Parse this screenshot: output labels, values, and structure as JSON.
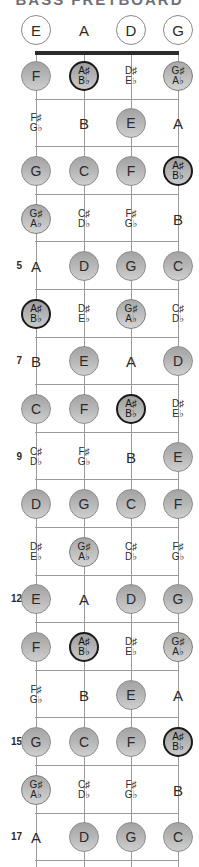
{
  "title_sliver": "BASS FRETBOARD",
  "diagram": {
    "instrument": "bass-guitar-fretboard",
    "string_labels": [
      "E",
      "A",
      "D",
      "G"
    ],
    "fret_number_labels": [
      "5",
      "7",
      "9",
      "12",
      "15",
      "17"
    ],
    "colors": {
      "nut": "#2b2b2b",
      "line": "#9a9a9a",
      "note_fill_top": "#a3a3a3",
      "note_fill_bottom": "#cfcfcf",
      "note_border": "#8d8d8d",
      "accent_border": "#1a1a1a",
      "text": "#2b2b2b",
      "background": "#ffffff"
    }
  },
  "open_strings": [
    {
      "label": "E",
      "style": "open"
    },
    {
      "label": "A",
      "style": "plain"
    },
    {
      "label": "D",
      "style": "open"
    },
    {
      "label": "G",
      "style": "open"
    }
  ],
  "frets": [
    {
      "number": 1,
      "number_shown": "",
      "notes": [
        {
          "label": "F",
          "style": "circ"
        },
        {
          "sharp": "A♯",
          "flat": "B♭",
          "style": "accent"
        },
        {
          "sharp": "D♯",
          "flat": "E♭",
          "style": "bare"
        },
        {
          "sharp": "G♯",
          "flat": "A♭",
          "style": "accentlite"
        }
      ]
    },
    {
      "number": 2,
      "number_shown": "",
      "notes": [
        {
          "sharp": "F♯",
          "flat": "G♭",
          "style": "bare"
        },
        {
          "label": "B",
          "style": "plain"
        },
        {
          "label": "E",
          "style": "circ"
        },
        {
          "label": "A",
          "style": "plain"
        }
      ]
    },
    {
      "number": 3,
      "number_shown": "",
      "notes": [
        {
          "label": "G",
          "style": "circ"
        },
        {
          "label": "C",
          "style": "circ"
        },
        {
          "label": "F",
          "style": "circ"
        },
        {
          "sharp": "A♯",
          "flat": "B♭",
          "style": "accent"
        }
      ]
    },
    {
      "number": 4,
      "number_shown": "",
      "notes": [
        {
          "sharp": "G♯",
          "flat": "A♭",
          "style": "accentlite"
        },
        {
          "sharp": "C♯",
          "flat": "D♭",
          "style": "bare"
        },
        {
          "sharp": "F♯",
          "flat": "G♭",
          "style": "bare"
        },
        {
          "label": "B",
          "style": "plain"
        }
      ]
    },
    {
      "number": 5,
      "number_shown": "5",
      "notes": [
        {
          "label": "A",
          "style": "plain"
        },
        {
          "label": "D",
          "style": "circ"
        },
        {
          "label": "G",
          "style": "circ"
        },
        {
          "label": "C",
          "style": "circ"
        }
      ]
    },
    {
      "number": 6,
      "number_shown": "",
      "notes": [
        {
          "sharp": "A♯",
          "flat": "B♭",
          "style": "accent"
        },
        {
          "sharp": "D♯",
          "flat": "E♭",
          "style": "bare"
        },
        {
          "sharp": "G♯",
          "flat": "A♭",
          "style": "accentlite"
        },
        {
          "sharp": "C♯",
          "flat": "D♭",
          "style": "bare"
        }
      ]
    },
    {
      "number": 7,
      "number_shown": "7",
      "notes": [
        {
          "label": "B",
          "style": "plain"
        },
        {
          "label": "E",
          "style": "circ"
        },
        {
          "label": "A",
          "style": "plain"
        },
        {
          "label": "D",
          "style": "circ"
        }
      ]
    },
    {
      "number": 8,
      "number_shown": "",
      "notes": [
        {
          "label": "C",
          "style": "circ"
        },
        {
          "label": "F",
          "style": "circ"
        },
        {
          "sharp": "A♯",
          "flat": "B♭",
          "style": "accent"
        },
        {
          "sharp": "D♯",
          "flat": "E♭",
          "style": "bare"
        }
      ]
    },
    {
      "number": 9,
      "number_shown": "9",
      "notes": [
        {
          "sharp": "C♯",
          "flat": "D♭",
          "style": "bare"
        },
        {
          "sharp": "F♯",
          "flat": "G♭",
          "style": "bare"
        },
        {
          "label": "B",
          "style": "plain"
        },
        {
          "label": "E",
          "style": "circ"
        }
      ]
    },
    {
      "number": 10,
      "number_shown": "",
      "notes": [
        {
          "label": "D",
          "style": "circ"
        },
        {
          "label": "G",
          "style": "circ"
        },
        {
          "label": "C",
          "style": "circ"
        },
        {
          "label": "F",
          "style": "circ"
        }
      ]
    },
    {
      "number": 11,
      "number_shown": "",
      "notes": [
        {
          "sharp": "D♯",
          "flat": "E♭",
          "style": "bare"
        },
        {
          "sharp": "G♯",
          "flat": "A♭",
          "style": "accentlite"
        },
        {
          "sharp": "C♯",
          "flat": "D♭",
          "style": "bare"
        },
        {
          "sharp": "F♯",
          "flat": "G♭",
          "style": "bare"
        }
      ]
    },
    {
      "number": 12,
      "number_shown": "12",
      "notes": [
        {
          "label": "E",
          "style": "circ"
        },
        {
          "label": "A",
          "style": "plain"
        },
        {
          "label": "D",
          "style": "circ"
        },
        {
          "label": "G",
          "style": "circ"
        }
      ]
    },
    {
      "number": 13,
      "number_shown": "",
      "notes": [
        {
          "label": "F",
          "style": "circ"
        },
        {
          "sharp": "A♯",
          "flat": "B♭",
          "style": "accent"
        },
        {
          "sharp": "D♯",
          "flat": "E♭",
          "style": "bare"
        },
        {
          "sharp": "G♯",
          "flat": "A♭",
          "style": "accentlite"
        }
      ]
    },
    {
      "number": 14,
      "number_shown": "",
      "notes": [
        {
          "sharp": "F♯",
          "flat": "G♭",
          "style": "bare"
        },
        {
          "label": "B",
          "style": "plain"
        },
        {
          "label": "E",
          "style": "circ"
        },
        {
          "label": "A",
          "style": "plain"
        }
      ]
    },
    {
      "number": 15,
      "number_shown": "15",
      "notes": [
        {
          "label": "G",
          "style": "circ"
        },
        {
          "label": "C",
          "style": "circ"
        },
        {
          "label": "F",
          "style": "circ"
        },
        {
          "sharp": "A♯",
          "flat": "B♭",
          "style": "accent"
        }
      ]
    },
    {
      "number": 16,
      "number_shown": "",
      "notes": [
        {
          "sharp": "G♯",
          "flat": "A♭",
          "style": "accentlite"
        },
        {
          "sharp": "C♯",
          "flat": "D♭",
          "style": "bare"
        },
        {
          "sharp": "F♯",
          "flat": "G♭",
          "style": "bare"
        },
        {
          "label": "B",
          "style": "plain"
        }
      ]
    },
    {
      "number": 17,
      "number_shown": "17",
      "notes": [
        {
          "label": "A",
          "style": "plain"
        },
        {
          "label": "D",
          "style": "circ"
        },
        {
          "label": "G",
          "style": "circ"
        },
        {
          "label": "C",
          "style": "circ"
        }
      ]
    }
  ]
}
